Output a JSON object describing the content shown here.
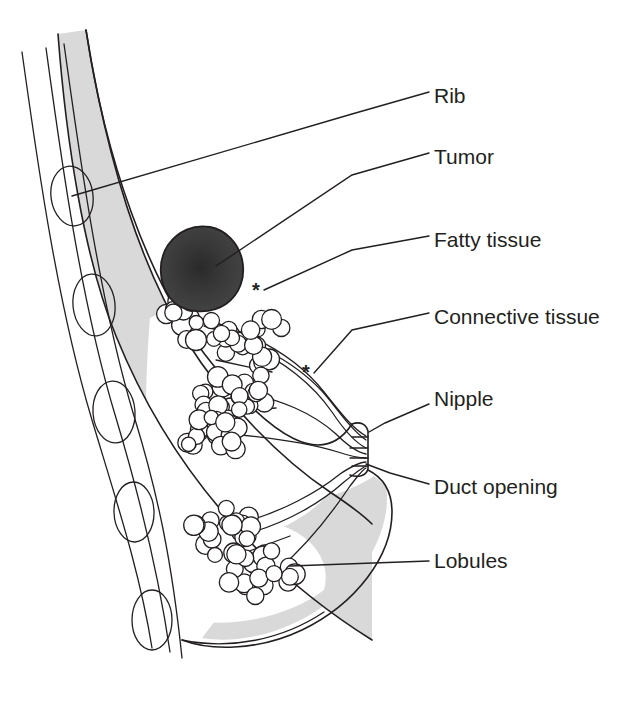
{
  "figure": {
    "width": 624,
    "height": 706,
    "background_color": "#ffffff",
    "ink_color": "#231f20"
  },
  "colors": {
    "tissue_gray": "#d9d9d9",
    "tissue_gray_light": "#e6e6e6",
    "tumor_fill": "#3b3b3b",
    "tumor_core": "#2a2a2a",
    "outline": "#231f20",
    "white": "#ffffff",
    "label_text": "#231f20"
  },
  "labels": [
    {
      "id": "rib",
      "text": "Rib",
      "text_x": 434,
      "text_y": 97,
      "leader": "M 429 92 L 352 114 L 72 196",
      "marker": null
    },
    {
      "id": "tumor",
      "text": "Tumor",
      "text_x": 434,
      "text_y": 158,
      "leader": "M 429 153 L 352 175 L 216 266",
      "marker": null
    },
    {
      "id": "fatty-tissue",
      "text": "Fatty tissue",
      "text_x": 434,
      "text_y": 241,
      "leader": "M 429 236 L 352 250 L 264 290",
      "marker": {
        "glyph": "*",
        "x": 256,
        "y": 292,
        "label_for": "fatty-tissue"
      }
    },
    {
      "id": "connective-tissue",
      "text": "Connective tissue",
      "text_x": 434,
      "text_y": 318,
      "leader": "M 429 313 L 352 330 L 314 373",
      "marker": {
        "glyph": "*",
        "x": 306,
        "y": 374,
        "label_for": "connective-tissue"
      }
    },
    {
      "id": "nipple",
      "text": "Nipple",
      "text_x": 434,
      "text_y": 400,
      "leader": "M 429 404 L 385 423 L 369 432",
      "marker": null
    },
    {
      "id": "duct-opening",
      "text": "Duct opening",
      "text_x": 434,
      "text_y": 488,
      "leader": "M 429 484 L 390 473 L 366 464",
      "marker": null
    },
    {
      "id": "lobules",
      "text": "Lobules",
      "text_x": 434,
      "text_y": 562,
      "leader": "M 429 561 L 290 566",
      "marker": null
    }
  ],
  "anatomy": {
    "chest_wall": {
      "name": "chest-wall",
      "lines": [
        "M 22 52 C 38 150 58 300 95 420 C 118 498 140 570 152 640",
        "M 46 48 C 62 148 82 300 118 418 C 142 496 160 568 172 648",
        "M 64 44 C 80 142 100 296 136 416 C 160 492 174 560 184 652"
      ]
    },
    "muscle_band": {
      "name": "pectoral-muscle-band",
      "path": "M 86 30 C 108 150 150 270 214 352 C 266 420 318 470 352 500 L 352 620 C 300 570 240 500 190 420 C 130 320 96 180 78 32 Z"
    },
    "ribs": [
      {
        "cx": 72,
        "cy": 196,
        "rx": 21,
        "ry": 30,
        "rot": -8
      },
      {
        "cx": 94,
        "cy": 305,
        "rx": 21,
        "ry": 31,
        "rot": -6
      },
      {
        "cx": 114,
        "cy": 412,
        "rx": 21,
        "ry": 31,
        "rot": -4
      },
      {
        "cx": 134,
        "cy": 512,
        "rx": 20,
        "ry": 30,
        "rot": -2
      },
      {
        "cx": 150,
        "cy": 620,
        "rx": 20,
        "ry": 30,
        "rot": 0
      }
    ],
    "breast_outline": {
      "name": "breast-outline",
      "path": "M 86 30 C 110 160 160 300 236 388 C 300 460 340 476 366 466 C 382 474 392 480 392 500 C 392 546 356 600 300 628 C 250 652 200 650 182 640"
    },
    "tumor": {
      "name": "tumor-mass",
      "path": "M 168 295 C 156 278 160 256 172 243 C 184 230 202 226 216 232 C 230 238 238 252 239 268 C 240 286 232 300 216 306 C 198 313 178 310 168 295 Z",
      "center_x": 202,
      "center_y": 270
    },
    "nipple": {
      "name": "nipple",
      "path": "M 352 424 C 360 422 366 424 368 430 L 368 470 C 366 476 358 478 350 476"
    },
    "duct_openings_count": 4,
    "lobule_clusters": [
      {
        "id": "cluster-upper-left",
        "cx": 186,
        "cy": 320,
        "spread_x": 28,
        "spread_y": 22,
        "count": 14
      },
      {
        "id": "cluster-upper-mid",
        "cx": 252,
        "cy": 340,
        "spread_x": 40,
        "spread_y": 26,
        "count": 22
      },
      {
        "id": "cluster-mid",
        "cx": 232,
        "cy": 390,
        "spread_x": 42,
        "spread_y": 30,
        "count": 24
      },
      {
        "id": "cluster-mid-left",
        "cx": 216,
        "cy": 432,
        "spread_x": 34,
        "spread_y": 26,
        "count": 18
      },
      {
        "id": "cluster-lower-left",
        "cx": 224,
        "cy": 532,
        "spread_x": 32,
        "spread_y": 26,
        "count": 18
      },
      {
        "id": "cluster-lower",
        "cx": 258,
        "cy": 570,
        "spread_x": 38,
        "spread_y": 26,
        "count": 20
      }
    ],
    "ducts": [
      "M 204 318 L 300 360 L 340 424 L 366 440",
      "M 236 344 L 312 386 L 346 438",
      "M 244 392 L 318 414 L 350 444",
      "M 230 430 L 310 442 L 352 450",
      "M 240 520 L 310 490 L 352 462",
      "M 268 562 L 324 506 L 356 468"
    ]
  }
}
